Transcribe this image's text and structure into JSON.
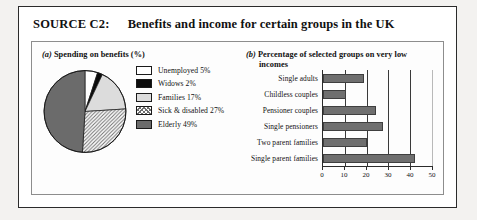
{
  "source": {
    "label": "SOURCE C2:",
    "title": "Benefits and income for certain groups in the UK"
  },
  "chart_a": {
    "caption_marker": "(a)",
    "caption_text": "Spending on benefits (%)",
    "legend": [
      {
        "label": "Unemployed 5%",
        "swatch": "white",
        "color": "#ffffff"
      },
      {
        "label": "Widows 2%",
        "swatch": "black",
        "color": "#0c0c0c"
      },
      {
        "label": "Families 17%",
        "swatch": "light-gray",
        "color": "#dcdcdc"
      },
      {
        "label": "Sick & disabled 27%",
        "swatch": "hatched",
        "color": "#6f6f6f"
      },
      {
        "label": "Elderly 49%",
        "swatch": "dark-gray",
        "color": "#6b6b6b"
      }
    ]
  },
  "chart_b": {
    "caption_marker": "(b)",
    "caption_line1": "Percentage of selected groups on very low",
    "caption_line2": "incomes"
  },
  "chart_data": [
    {
      "type": "pie",
      "title": "Spending on benefits (%)",
      "labels": [
        "Unemployed",
        "Widows",
        "Families",
        "Sick & disabled",
        "Elderly"
      ],
      "values": [
        5,
        2,
        17,
        27,
        49
      ],
      "unit": "%",
      "legend_position": "right",
      "colors": [
        "#ffffff",
        "#0c0c0c",
        "#dcdcdc",
        "#6f6f6f",
        "#6b6b6b"
      ]
    },
    {
      "type": "bar",
      "orientation": "horizontal",
      "title": "Percentage of selected groups on very low incomes",
      "categories": [
        "Single adults",
        "Childless couples",
        "Pensioner couples",
        "Single pensioners",
        "Two parent families",
        "Single parent families"
      ],
      "values": [
        19,
        10.5,
        24.5,
        27.5,
        20,
        42
      ],
      "xlabel": "",
      "ylabel": "",
      "xlim": [
        0,
        50
      ],
      "xticks": [
        0,
        10,
        20,
        30,
        40,
        50
      ],
      "xtick_labels": [
        "0",
        "10",
        "20",
        "30",
        "40",
        "50"
      ],
      "grid": true,
      "bar_color": "#6f6f6f"
    }
  ]
}
